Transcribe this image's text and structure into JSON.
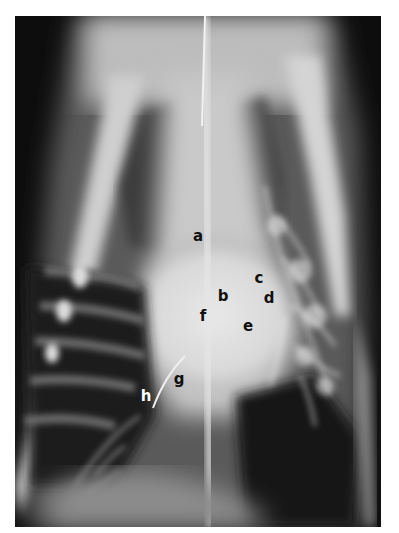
{
  "figure": {
    "type": "radiograph",
    "view": "dorsoventral thoracic x-ray",
    "labels": [
      {
        "text": "a",
        "x": 198,
        "y": 236,
        "color": "#111111"
      },
      {
        "text": "b",
        "x": 223,
        "y": 296,
        "color": "#111111"
      },
      {
        "text": "c",
        "x": 259,
        "y": 278,
        "color": "#111111"
      },
      {
        "text": "d",
        "x": 269,
        "y": 298,
        "color": "#111111"
      },
      {
        "text": "e",
        "x": 248,
        "y": 326,
        "color": "#111111"
      },
      {
        "text": "f",
        "x": 203,
        "y": 316,
        "color": "#111111"
      },
      {
        "text": "g",
        "x": 179,
        "y": 379,
        "color": "#111111"
      },
      {
        "text": "h",
        "x": 146,
        "y": 396,
        "color": "#ffffff"
      }
    ]
  }
}
